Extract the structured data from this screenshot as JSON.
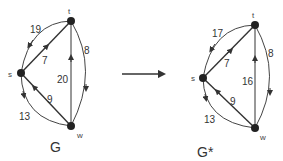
{
  "transform_arrow": {
    "from": "G",
    "to": "G*"
  },
  "graphs": [
    {
      "name": "G",
      "nodes": {
        "t": "t",
        "s": "s",
        "w": "w"
      },
      "edges": [
        {
          "from": "t",
          "to": "s",
          "weight": "19",
          "shape": "curved-outer"
        },
        {
          "from": "s",
          "to": "t",
          "weight": "7",
          "shape": "straight"
        },
        {
          "from": "t",
          "to": "w",
          "weight": "8",
          "shape": "curved-outer"
        },
        {
          "from": "w",
          "to": "t",
          "weight": "20",
          "shape": "straight"
        },
        {
          "from": "w",
          "to": "s",
          "weight": "9",
          "shape": "straight"
        },
        {
          "from": "s",
          "to": "w",
          "weight": "13",
          "shape": "curved-outer"
        }
      ]
    },
    {
      "name": "G*",
      "nodes": {
        "t": "t",
        "s": "s",
        "w": "w"
      },
      "edges": [
        {
          "from": "t",
          "to": "s",
          "weight": "17",
          "shape": "curved-outer"
        },
        {
          "from": "s",
          "to": "t",
          "weight": "7",
          "shape": "straight"
        },
        {
          "from": "t",
          "to": "w",
          "weight": "8",
          "shape": "curved-outer"
        },
        {
          "from": "w",
          "to": "t",
          "weight": "16",
          "shape": "straight"
        },
        {
          "from": "w",
          "to": "s",
          "weight": "9",
          "shape": "straight"
        },
        {
          "from": "s",
          "to": "w",
          "weight": "13",
          "shape": "curved-outer"
        }
      ]
    }
  ]
}
